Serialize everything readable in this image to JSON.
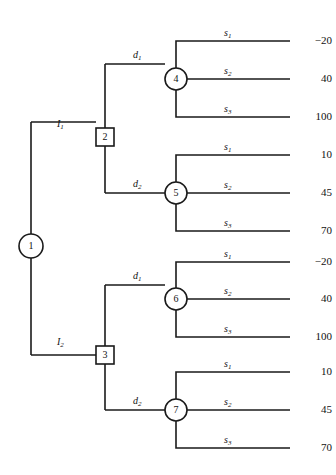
{
  "diagram": {
    "type": "decision-tree",
    "stroke_color": "#1a1a1a",
    "background_color": "#ffffff"
  },
  "nodes": [
    {
      "id": "1",
      "label": "1",
      "shape": "circle",
      "kind": "decision-root",
      "x": 31,
      "y": 246,
      "r": 12
    },
    {
      "id": "2",
      "label": "2",
      "shape": "square",
      "kind": "decision",
      "x": 105,
      "y": 137,
      "size": 18
    },
    {
      "id": "3",
      "label": "3",
      "shape": "square",
      "kind": "decision",
      "x": 105,
      "y": 355,
      "size": 18
    },
    {
      "id": "4",
      "label": "4",
      "shape": "circle",
      "kind": "chance",
      "x": 176,
      "y": 79,
      "r": 11
    },
    {
      "id": "5",
      "label": "5",
      "shape": "circle",
      "kind": "chance",
      "x": 176,
      "y": 193,
      "r": 11
    },
    {
      "id": "6",
      "label": "6",
      "shape": "circle",
      "kind": "chance",
      "x": 176,
      "y": 299,
      "r": 11
    },
    {
      "id": "7",
      "label": "7",
      "shape": "circle",
      "kind": "chance",
      "x": 176,
      "y": 410,
      "r": 11
    }
  ],
  "information_branches": [
    {
      "id": "I1",
      "base": "I",
      "sub": "1",
      "from": "1",
      "to": "2",
      "label_x": 57,
      "label_y": 119
    },
    {
      "id": "I2",
      "base": "I",
      "sub": "2",
      "from": "1",
      "to": "3",
      "label_x": 57,
      "label_y": 337
    }
  ],
  "decision_branches": [
    {
      "id": "d1-2",
      "base": "d",
      "sub": "1",
      "from": "2",
      "to": "4",
      "label_x": 133,
      "label_y": 60
    },
    {
      "id": "d2-2",
      "base": "d",
      "sub": "2",
      "from": "2",
      "to": "5",
      "label_x": 133,
      "label_y": 175
    },
    {
      "id": "d1-3",
      "base": "d",
      "sub": "1",
      "from": "3",
      "to": "6",
      "label_x": 133,
      "label_y": 281
    },
    {
      "id": "d2-3",
      "base": "d",
      "sub": "2",
      "from": "3",
      "to": "7",
      "label_x": 133,
      "label_y": 392
    }
  ],
  "terminals": [
    {
      "chance": "4",
      "state_base": "s",
      "state_sub": "1",
      "payoff": "−20",
      "y": 41,
      "label_x": 229,
      "label_y": 24
    },
    {
      "chance": "4",
      "state_base": "s",
      "state_sub": "2",
      "payoff": "40",
      "y": 79,
      "label_x": 229,
      "label_y": 62
    },
    {
      "chance": "4",
      "state_base": "s",
      "state_sub": "3",
      "payoff": "100",
      "y": 117,
      "label_x": 229,
      "label_y": 100
    },
    {
      "chance": "5",
      "state_base": "s",
      "state_sub": "1",
      "payoff": "10",
      "y": 155,
      "label_x": 229,
      "label_y": 138
    },
    {
      "chance": "5",
      "state_base": "s",
      "state_sub": "2",
      "payoff": "45",
      "y": 193,
      "label_x": 229,
      "label_y": 176
    },
    {
      "chance": "5",
      "state_base": "s",
      "state_sub": "3",
      "payoff": "70",
      "y": 231,
      "label_x": 229,
      "label_y": 214
    },
    {
      "chance": "6",
      "state_base": "s",
      "state_sub": "1",
      "payoff": "−20",
      "y": 262,
      "label_x": 229,
      "label_y": 245
    },
    {
      "chance": "6",
      "state_base": "s",
      "state_sub": "2",
      "payoff": "40",
      "y": 299,
      "label_x": 229,
      "label_y": 282
    },
    {
      "chance": "6",
      "state_base": "s",
      "state_sub": "3",
      "payoff": "100",
      "y": 337,
      "label_x": 229,
      "label_y": 320
    },
    {
      "chance": "7",
      "state_base": "s",
      "state_sub": "1",
      "payoff": "10",
      "y": 372,
      "label_x": 229,
      "label_y": 355
    },
    {
      "chance": "7",
      "state_base": "s",
      "state_sub": "2",
      "payoff": "45",
      "y": 410,
      "label_x": 229,
      "label_y": 393
    },
    {
      "chance": "7",
      "state_base": "s",
      "state_sub": "3",
      "payoff": "70",
      "y": 448,
      "label_x": 229,
      "label_y": 431
    }
  ]
}
